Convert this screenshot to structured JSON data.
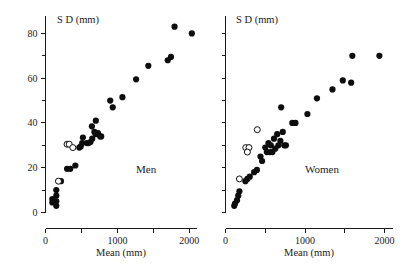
{
  "figure": {
    "title": "",
    "background_color": "#ffffff",
    "marker_color": "#0d0d0d",
    "axis_color": "#1a1a1a"
  },
  "chart_data": [
    {
      "type": "scatter",
      "title": "Men",
      "panel_label": "Men",
      "xlabel": "Mean (mm)",
      "ylabel": "S D (mm)",
      "xlim": [
        0,
        2100
      ],
      "ylim": [
        0,
        88
      ],
      "grid": false,
      "legend": "none",
      "xticks": [
        0,
        500,
        1000,
        1500,
        2000
      ],
      "xtick_labels": [
        "0",
        "",
        "1000",
        "",
        "2000"
      ],
      "yticks": [
        0,
        10,
        20,
        30,
        40,
        50,
        60,
        70,
        80
      ],
      "ytick_labels": [
        "0",
        "",
        "20",
        "",
        "40",
        "",
        "60",
        "",
        "80"
      ],
      "series": [
        {
          "name": "filled",
          "marker": "filled-circle",
          "points": [
            [
              95,
              6
            ],
            [
              95,
              4.5
            ],
            [
              150,
              10
            ],
            [
              150,
              7.5
            ],
            [
              150,
              5
            ],
            [
              150,
              3
            ],
            [
              215,
              14
            ],
            [
              300,
              19.5
            ],
            [
              345,
              19.5
            ],
            [
              415,
              21
            ],
            [
              470,
              29
            ],
            [
              490,
              29.5
            ],
            [
              510,
              31
            ],
            [
              520,
              33.5
            ],
            [
              575,
              31
            ],
            [
              600,
              31
            ],
            [
              625,
              31.5
            ],
            [
              645,
              38.5
            ],
            [
              650,
              33
            ],
            [
              680,
              36
            ],
            [
              700,
              41
            ],
            [
              700,
              35
            ],
            [
              730,
              35.5
            ],
            [
              760,
              34
            ],
            [
              775,
              34
            ],
            [
              900,
              50
            ],
            [
              935,
              47
            ],
            [
              1070,
              51.5
            ],
            [
              1260,
              59.5
            ],
            [
              1430,
              65.5
            ],
            [
              1700,
              68
            ],
            [
              1745,
              69.5
            ],
            [
              1795,
              83
            ],
            [
              2035,
              80
            ]
          ]
        },
        {
          "name": "open",
          "marker": "open-circle",
          "points": [
            [
              180,
              14
            ],
            [
              300,
              30.5
            ],
            [
              330,
              30.5
            ],
            [
              380,
              29
            ]
          ]
        }
      ]
    },
    {
      "type": "scatter",
      "title": "Women",
      "panel_label": "Women",
      "xlabel": "Mean (mm)",
      "ylabel": "S D (mm)",
      "xlim": [
        0,
        2100
      ],
      "ylim": [
        0,
        88
      ],
      "grid": false,
      "legend": "none",
      "xticks": [
        0,
        500,
        1000,
        1500,
        2000
      ],
      "xtick_labels": [
        "0",
        "",
        "1000",
        "",
        "2000"
      ],
      "yticks": [
        0,
        10,
        20,
        30,
        40,
        50,
        60,
        70,
        80
      ],
      "ytick_labels": [
        "",
        "",
        "",
        "",
        "",
        "",
        "",
        "",
        ""
      ],
      "series": [
        {
          "name": "filled",
          "marker": "filled-circle",
          "points": [
            [
              110,
              3
            ],
            [
              120,
              4
            ],
            [
              145,
              5.5
            ],
            [
              160,
              7.5
            ],
            [
              175,
              9.5
            ],
            [
              250,
              14
            ],
            [
              275,
              15
            ],
            [
              305,
              16
            ],
            [
              360,
              18
            ],
            [
              395,
              19
            ],
            [
              440,
              25
            ],
            [
              460,
              23
            ],
            [
              500,
              29
            ],
            [
              520,
              27
            ],
            [
              540,
              31
            ],
            [
              560,
              27
            ],
            [
              570,
              30
            ],
            [
              590,
              27
            ],
            [
              610,
              33
            ],
            [
              625,
              28.5
            ],
            [
              650,
              35
            ],
            [
              665,
              30
            ],
            [
              690,
              32
            ],
            [
              700,
              47
            ],
            [
              720,
              36
            ],
            [
              740,
              30
            ],
            [
              760,
              30
            ],
            [
              840,
              40
            ],
            [
              880,
              40
            ],
            [
              1030,
              44
            ],
            [
              1150,
              51
            ],
            [
              1345,
              55
            ],
            [
              1475,
              59
            ],
            [
              1580,
              58
            ],
            [
              1595,
              70
            ],
            [
              1935,
              70
            ]
          ]
        },
        {
          "name": "open",
          "marker": "open-circle",
          "points": [
            [
              175,
              15
            ],
            [
              255,
              29
            ],
            [
              295,
              29
            ],
            [
              275,
              27
            ],
            [
              400,
              37
            ]
          ]
        }
      ]
    }
  ]
}
